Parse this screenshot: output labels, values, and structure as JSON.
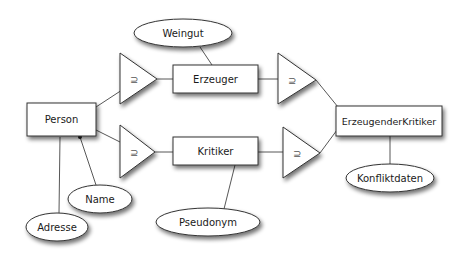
{
  "diagram": {
    "type": "er-diagram",
    "entities": [
      {
        "id": "person",
        "label": "Person",
        "x": 27,
        "y": 103,
        "w": 69,
        "h": 33
      },
      {
        "id": "erzeuger",
        "label": "Erzeuger",
        "x": 173,
        "y": 65,
        "w": 85,
        "h": 28
      },
      {
        "id": "kritiker",
        "label": "Kritiker",
        "x": 173,
        "y": 137,
        "w": 85,
        "h": 28
      },
      {
        "id": "erzeugender-kritiker",
        "label": "ErzeugenderKritiker",
        "x": 336,
        "y": 106,
        "w": 106,
        "h": 30
      }
    ],
    "attributes": [
      {
        "id": "weingut",
        "label": "Weingut",
        "cx": 183,
        "cy": 33,
        "rx": 49,
        "ry": 14
      },
      {
        "id": "name",
        "label": "Name",
        "cx": 100,
        "cy": 199,
        "rx": 32,
        "ry": 14
      },
      {
        "id": "adresse",
        "label": "Adresse",
        "cx": 57,
        "cy": 227,
        "rx": 31,
        "ry": 14
      },
      {
        "id": "pseudonym",
        "label": "Pseudonym",
        "cx": 208,
        "cy": 222,
        "rx": 52,
        "ry": 14
      },
      {
        "id": "konfliktdaten",
        "label": "Konfliktdaten",
        "cx": 390,
        "cy": 178,
        "rx": 44,
        "ry": 14
      }
    ],
    "specializations": [
      {
        "id": "spec-person-erzeuger",
        "symbol": "⊇"
      },
      {
        "id": "spec-person-kritiker",
        "symbol": "⊇"
      },
      {
        "id": "spec-erzeuger-ek",
        "symbol": "⊇"
      },
      {
        "id": "spec-kritiker-ek",
        "symbol": "⊇"
      }
    ]
  }
}
